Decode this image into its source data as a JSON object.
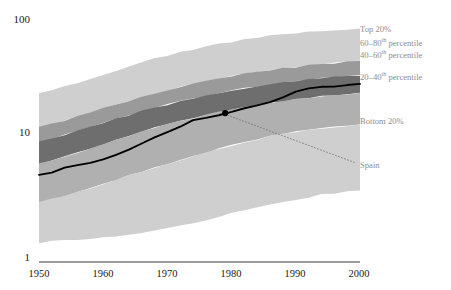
{
  "chart_data": {
    "type": "area",
    "title": "",
    "subtitle": "",
    "xlabel": "",
    "ylabel": "",
    "scale": "log",
    "grid": false,
    "legend_position": "right",
    "xlim": [
      1950,
      2000
    ],
    "ylim": [
      1,
      100
    ],
    "x_ticks": [
      "1950",
      "1960",
      "1970",
      "1980",
      "1990",
      "2000"
    ],
    "x_tick_values": [
      1950,
      1960,
      1970,
      1980,
      1990,
      2000
    ],
    "y_ticks": [
      "1",
      "10",
      "100"
    ],
    "y_tick_values": [
      1,
      10,
      100
    ],
    "x": [
      1950,
      1952,
      1954,
      1956,
      1958,
      1960,
      1962,
      1964,
      1966,
      1968,
      1970,
      1972,
      1974,
      1976,
      1978,
      1980,
      1982,
      1984,
      1986,
      1988,
      1990,
      1992,
      1994,
      1996,
      1998,
      2000
    ],
    "bands": [
      {
        "name": "Top 20%",
        "color": "#cfcfcf",
        "upper": [
          25.0,
          26.5,
          28.5,
          30.5,
          33.0,
          35.5,
          38.5,
          41.5,
          45.0,
          48.0,
          51.0,
          54.0,
          57.0,
          60.0,
          63.0,
          66.0,
          69.0,
          71.5,
          74.0,
          76.0,
          78.0,
          79.5,
          81.0,
          82.0,
          83.0,
          84.0
        ],
        "lower": [
          13.0,
          13.8,
          14.8,
          16.0,
          17.3,
          18.6,
          20.0,
          21.5,
          23.0,
          24.6,
          26.2,
          27.8,
          29.4,
          31.0,
          32.6,
          34.2,
          35.8,
          37.2,
          38.6,
          39.8,
          41.0,
          42.0,
          43.0,
          44.0,
          45.0,
          46.0
        ]
      },
      {
        "name": "60–80th percentile",
        "color": "#9a9a9a",
        "upper": [
          13.0,
          13.8,
          14.8,
          16.0,
          17.3,
          18.6,
          20.0,
          21.5,
          23.0,
          24.6,
          26.2,
          27.8,
          29.4,
          31.0,
          32.6,
          34.2,
          35.8,
          37.2,
          38.6,
          39.8,
          41.0,
          42.0,
          43.0,
          44.0,
          45.0,
          46.0
        ],
        "lower": [
          9.8,
          10.4,
          11.2,
          12.1,
          13.1,
          14.1,
          15.2,
          16.4,
          17.6,
          18.8,
          20.0,
          21.2,
          22.4,
          23.6,
          24.8,
          26.0,
          27.2,
          28.3,
          29.4,
          30.4,
          31.3,
          32.1,
          32.9,
          33.6,
          34.3,
          35.0
        ]
      },
      {
        "name": "40–60th percentile",
        "color": "#6e6e6e",
        "upper": [
          9.8,
          10.4,
          11.2,
          12.1,
          13.1,
          14.1,
          15.2,
          16.4,
          17.6,
          18.8,
          20.0,
          21.2,
          22.4,
          23.6,
          24.8,
          26.0,
          27.2,
          28.3,
          29.4,
          30.4,
          31.3,
          32.1,
          32.9,
          33.6,
          34.3,
          35.0
        ],
        "lower": [
          6.5,
          6.9,
          7.4,
          8.0,
          8.7,
          9.4,
          10.2,
          11.0,
          11.9,
          12.8,
          13.7,
          14.6,
          15.5,
          16.4,
          17.3,
          18.2,
          19.1,
          19.9,
          20.7,
          21.4,
          22.1,
          22.8,
          23.4,
          24.0,
          24.5,
          25.0
        ]
      },
      {
        "name": "20–40th percentile",
        "color": "#b0b0b0",
        "upper": [
          6.5,
          6.9,
          7.4,
          8.0,
          8.7,
          9.4,
          10.2,
          11.0,
          11.9,
          12.8,
          13.7,
          14.6,
          15.5,
          16.4,
          17.3,
          18.2,
          19.1,
          19.9,
          20.7,
          21.4,
          22.1,
          22.8,
          23.4,
          24.0,
          24.5,
          25.0
        ],
        "lower": [
          3.1,
          3.3,
          3.5,
          3.8,
          4.1,
          4.4,
          4.8,
          5.2,
          5.6,
          6.0,
          6.5,
          7.0,
          7.5,
          8.0,
          8.6,
          9.2,
          9.8,
          10.3,
          10.9,
          11.4,
          11.9,
          12.3,
          12.7,
          13.1,
          13.4,
          13.7
        ]
      },
      {
        "name": "Bottom 20%",
        "color": "#cfcfcf",
        "upper": [
          3.1,
          3.3,
          3.5,
          3.8,
          4.1,
          4.4,
          4.8,
          5.2,
          5.6,
          6.0,
          6.5,
          7.0,
          7.5,
          8.0,
          8.6,
          9.2,
          9.8,
          10.3,
          10.9,
          11.4,
          11.9,
          12.3,
          12.7,
          13.1,
          13.4,
          13.7
        ],
        "lower": [
          1.45,
          1.48,
          1.5,
          1.52,
          1.55,
          1.58,
          1.62,
          1.66,
          1.72,
          1.8,
          1.9,
          2.0,
          2.1,
          2.22,
          2.36,
          2.52,
          2.68,
          2.85,
          3.0,
          3.15,
          3.3,
          3.45,
          3.6,
          3.72,
          3.85,
          3.95
        ]
      }
    ],
    "series": [
      {
        "name": "Spain",
        "color": "#000000",
        "type": "line",
        "values": [
          5.2,
          5.5,
          6.0,
          6.3,
          6.6,
          7.0,
          7.6,
          8.5,
          9.5,
          10.6,
          11.8,
          13.2,
          14.8,
          15.6,
          16.4,
          17.5,
          18.6,
          19.6,
          21.0,
          23.0,
          25.5,
          27.0,
          27.8,
          28.4,
          29.0,
          29.5
        ]
      }
    ],
    "annotations": [
      {
        "label": "Spain",
        "point_x": 1979,
        "point_y": 17.0,
        "marker": "dot",
        "leader": true
      }
    ],
    "legend_entries": [
      {
        "label": "Top 20%",
        "color": "#cfcfcf",
        "sup": ""
      },
      {
        "label": "60–80",
        "sup": "th",
        "suffix": " percentile",
        "color": "#9a9a9a"
      },
      {
        "label": "40–60",
        "sup": "th",
        "suffix": " percentile",
        "color": "#6e6e6e"
      },
      {
        "label": "20–40",
        "sup": "th",
        "suffix": " percentile",
        "color": "#b0b0b0"
      },
      {
        "label": "Bottom 20%",
        "color": "#cfcfcf",
        "sup": ""
      }
    ]
  },
  "axes": {
    "y_top_label": "100",
    "y_mid_label": "10",
    "y_bottom_label": "1",
    "x_labels": [
      "1950",
      "1960",
      "1970",
      "1980",
      "1990",
      "2000"
    ]
  },
  "legend": {
    "top20_label": "Top 20%",
    "p6080_prefix": "60–80",
    "p6080_sup": "th",
    "p6080_suffix": " percentile",
    "p4060_prefix": "40–60",
    "p4060_sup": "th",
    "p4060_suffix": " percentile",
    "p2040_prefix": "20–40",
    "p2040_sup": "th",
    "p2040_suffix": " percentile",
    "bottom20_label": "Bottom 20%",
    "spain_label": "Spain"
  },
  "colors": {
    "band_outer": "#cfcfcf",
    "band_6080": "#9a9a9a",
    "band_4060": "#6e6e6e",
    "band_2040": "#b0b0b0",
    "line": "#000000",
    "axis": "#3a3a3a",
    "legend_text": "#8e8e8e",
    "tick_text": "#1a1a1a"
  }
}
